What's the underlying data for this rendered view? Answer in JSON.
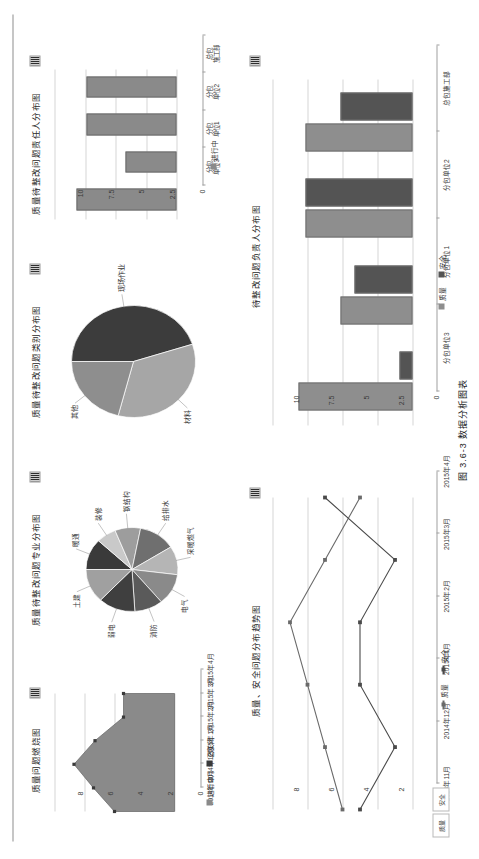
{
  "figure_caption": "图 3.6-3  数据分析图表",
  "side_tabs": [
    "质量",
    "安全"
  ],
  "panels": {
    "responsible_all": {
      "title": "待整改问题负责人分布图",
      "handle_icon": "chart-handle-icon"
    },
    "trend": {
      "title": "质量、安全问题分布趋势图",
      "handle_icon": "chart-handle-icon"
    },
    "responsible_quality": {
      "title": "质量待整改问题责任人分布图",
      "handle_icon": "chart-handle-icon"
    },
    "category_pie": {
      "title": "质量待整改问题类别分布图",
      "handle_icon": "chart-handle-icon"
    },
    "specialty_pie": {
      "title": "质量待整改问题专业分布图",
      "handle_icon": "chart-handle-icon"
    },
    "burndown": {
      "title": "质量问题燃烧图",
      "handle_icon": "chart-handle-icon"
    }
  },
  "chart_data": [
    {
      "id": "responsible_all",
      "type": "bar",
      "title": "待整改问题负责人分布图",
      "categories": [
        "分包单位3",
        "分包单位1",
        "分包单位2",
        "总包施工部"
      ],
      "series": [
        {
          "name": "质量",
          "color": "#8e8e8e",
          "values": [
            8,
            5,
            7.5,
            7.5
          ]
        },
        {
          "name": "安全",
          "color": "#545454",
          "values": [
            0.8,
            4,
            7.5,
            5
          ]
        }
      ],
      "ylabel": "",
      "xlabel": "",
      "ylim": [
        0,
        10
      ],
      "yticks": [
        0,
        2.5,
        5,
        7.5,
        10
      ],
      "ytick_labels": [
        "0",
        "2.5",
        "5",
        "7.5",
        "10"
      ],
      "grid": true,
      "legend": "bottom"
    },
    {
      "id": "trend",
      "type": "line",
      "title": "质量、安全问题分布趋势图",
      "categories": [
        "2014年11月",
        "2014年12月",
        "2015年1月",
        "2015年2月",
        "2015年3月",
        "2015年4月"
      ],
      "series": [
        {
          "name": "质量",
          "color": "#6a6a6a",
          "values": [
            4,
            5,
            6,
            7,
            5,
            3
          ]
        },
        {
          "name": "安全",
          "color": "#4a4a4a",
          "values": [
            3,
            1,
            3,
            3,
            1,
            5
          ]
        }
      ],
      "ylim": [
        0,
        8
      ],
      "yticks": [
        0,
        2,
        4,
        6,
        8
      ],
      "ytick_labels": [
        "0",
        "2",
        "4",
        "6",
        "8"
      ],
      "grid": true,
      "legend": "bottom"
    },
    {
      "id": "responsible_quality",
      "type": "bar",
      "title": "质量待整改问题责任人分布图",
      "categories": [
        "分包单位3",
        "分包单位1",
        "分包单位2",
        "总包施工部"
      ],
      "category_lines": [
        [
          "分包",
          "单位3"
        ],
        [
          "分包",
          "单位1"
        ],
        [
          "分包",
          "单位2"
        ],
        [
          "总包",
          "施工部"
        ]
      ],
      "series": [
        {
          "name": "进行中",
          "color": "#8a8a8a",
          "values": [
            8,
            4,
            7.2,
            7.2
          ]
        }
      ],
      "ylim": [
        0,
        10
      ],
      "yticks": [
        0,
        2.5,
        5,
        7.5,
        10
      ],
      "ytick_labels": [
        "0",
        "2.5",
        "5",
        "7.5",
        "10"
      ],
      "grid": true,
      "legend": "bottom"
    },
    {
      "id": "category_pie",
      "type": "pie",
      "title": "质量待整改问题类别分布图",
      "labels": [
        "现场作业",
        "材料",
        "其他"
      ],
      "values": [
        45,
        34,
        21
      ],
      "colors": [
        "#3c3c3c",
        "#a6a6a6",
        "#8e8e8e"
      ]
    },
    {
      "id": "specialty_pie",
      "type": "pie",
      "title": "质量待整改问题专业分布图",
      "labels": [
        "暖通",
        "装修",
        "钢结构",
        "给排水",
        "采暖燃气",
        "电气",
        "消防",
        "弱电",
        "土建"
      ],
      "values": [
        12,
        7,
        9,
        13,
        11,
        12,
        10,
        13,
        13
      ],
      "colors": [
        "#3a3a3a",
        "#c9c9c9",
        "#9d9d9d",
        "#6f6f6f",
        "#b5b5b5",
        "#8a8a8a",
        "#5a5a5a",
        "#3f3f3f",
        "#a0a0a0"
      ]
    },
    {
      "id": "burndown",
      "type": "area",
      "title": "质量问题燃烧图",
      "categories": [
        "2014年11月",
        "2014年12月",
        "2015年1月",
        "2015年2月",
        "2015年3月",
        "2015年4月"
      ],
      "series": [
        {
          "name": "进行中",
          "color": "#8a8a8a",
          "values": [
            4,
            5.4,
            6.7,
            5.3,
            3.4,
            3.4
          ]
        },
        {
          "name": "已关闭",
          "color": "#3a3a3a",
          "values": [
            0,
            0,
            0,
            0,
            0,
            0
          ]
        }
      ],
      "ylim": [
        0,
        8
      ],
      "yticks": [
        0,
        2,
        4,
        6,
        8
      ],
      "ytick_labels": [
        "0",
        "2",
        "4",
        "6",
        "8"
      ],
      "grid": true,
      "legend": "bottom"
    }
  ]
}
